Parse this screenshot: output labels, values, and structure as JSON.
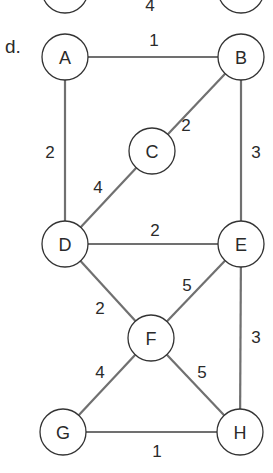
{
  "subfigure_label": "d.",
  "top_partial": {
    "edge_label": "4",
    "nodes": [
      {
        "cx": 65,
        "cy": -10
      },
      {
        "cx": 241,
        "cy": -10
      }
    ],
    "label_pos": [
      150,
      11
    ]
  },
  "style": {
    "edge_color": "#707070",
    "node_stroke": "#333333",
    "node_fill": "#ffffff",
    "text_color": "#2a2a2a",
    "node_radius": 23
  },
  "graph": {
    "nodes": [
      {
        "id": "A",
        "label": "A",
        "cx": 65,
        "cy": 57
      },
      {
        "id": "B",
        "label": "B",
        "cx": 241,
        "cy": 57
      },
      {
        "id": "C",
        "label": "C",
        "cx": 152,
        "cy": 151
      },
      {
        "id": "D",
        "label": "D",
        "cx": 65,
        "cy": 244
      },
      {
        "id": "E",
        "label": "E",
        "cx": 241,
        "cy": 244
      },
      {
        "id": "F",
        "label": "F",
        "cx": 151,
        "cy": 338
      },
      {
        "id": "G",
        "label": "G",
        "cx": 63,
        "cy": 432
      },
      {
        "id": "H",
        "label": "H",
        "cx": 240,
        "cy": 432
      }
    ],
    "edges": [
      {
        "from": "A",
        "to": "B",
        "weight": "1",
        "lx": 154,
        "ly": 46
      },
      {
        "from": "A",
        "to": "D",
        "weight": "2",
        "lx": 50,
        "ly": 158
      },
      {
        "from": "B",
        "to": "C",
        "weight": "2",
        "lx": 186,
        "ly": 131
      },
      {
        "from": "B",
        "to": "E",
        "weight": "3",
        "lx": 256,
        "ly": 158
      },
      {
        "from": "C",
        "to": "D",
        "weight": "4",
        "lx": 98,
        "ly": 193
      },
      {
        "from": "D",
        "to": "E",
        "weight": "2",
        "lx": 155,
        "ly": 236
      },
      {
        "from": "D",
        "to": "F",
        "weight": "2",
        "lx": 100,
        "ly": 314
      },
      {
        "from": "E",
        "to": "F",
        "weight": "5",
        "lx": 187,
        "ly": 291
      },
      {
        "from": "E",
        "to": "H",
        "weight": "3",
        "lx": 256,
        "ly": 343
      },
      {
        "from": "F",
        "to": "G",
        "weight": "4",
        "lx": 100,
        "ly": 378
      },
      {
        "from": "F",
        "to": "H",
        "weight": "5",
        "lx": 202,
        "ly": 378
      },
      {
        "from": "G",
        "to": "H",
        "weight": "1",
        "lx": 157,
        "ly": 457
      }
    ]
  }
}
